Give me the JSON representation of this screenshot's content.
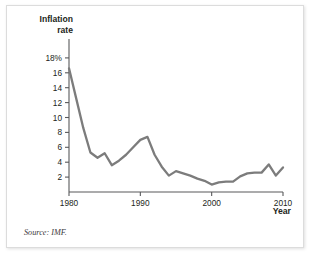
{
  "figure": {
    "y_axis_title_line1": "Inflation",
    "y_axis_title_line2": "rate",
    "x_axis_title": "Year",
    "source_note": "Source: IMF."
  },
  "chart_data": {
    "type": "line",
    "title": "",
    "subtitle": "",
    "xlabel": "Year",
    "ylabel": "Inflation rate",
    "grid": false,
    "legend": "none",
    "line_color": "#7c7c7c",
    "axis_color": "#58595b",
    "xlim": [
      1980,
      2010
    ],
    "ylim": [
      0,
      19
    ],
    "xticks": [
      1980,
      1990,
      2000,
      2010
    ],
    "xtick_labels": [
      "1980",
      "1990",
      "2000",
      "2010"
    ],
    "yticks": [
      2,
      4,
      6,
      8,
      10,
      12,
      14,
      16,
      18
    ],
    "ytick_labels": [
      "2",
      "4",
      "6",
      "8",
      "10",
      "12",
      "14",
      "16",
      "18%"
    ],
    "series": [
      {
        "name": "Inflation rate",
        "x": [
          1980,
          1981,
          1982,
          1983,
          1984,
          1985,
          1986,
          1987,
          1988,
          1989,
          1990,
          1991,
          1992,
          1993,
          1994,
          1995,
          1996,
          1997,
          1998,
          1999,
          2000,
          2001,
          2002,
          2003,
          2004,
          2005,
          2006,
          2007,
          2008,
          2009,
          2010
        ],
        "values": [
          16.6,
          12.6,
          8.6,
          5.3,
          4.6,
          5.2,
          3.6,
          4.2,
          5.0,
          6.0,
          7.0,
          7.4,
          5.0,
          3.4,
          2.2,
          2.8,
          2.5,
          2.2,
          1.8,
          1.5,
          1.0,
          1.3,
          1.4,
          1.4,
          2.1,
          2.5,
          2.6,
          2.6,
          3.7,
          2.2,
          3.3
        ]
      }
    ]
  },
  "geometry": {
    "x_of_1980": 68,
    "x_of_2010": 282,
    "y_of_0": 192,
    "y_of_18": 58
  }
}
